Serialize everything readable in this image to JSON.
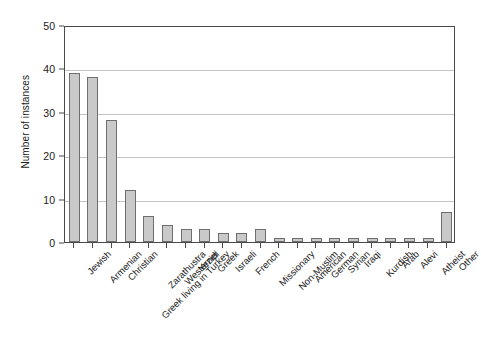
{
  "chart_data": {
    "type": "bar",
    "title": "",
    "subtitle": "",
    "xlabel": "",
    "ylabel": "Number of instances",
    "ylim": [
      0,
      50
    ],
    "yticks": [
      0,
      10,
      20,
      30,
      40,
      50
    ],
    "grid": "horizontal",
    "legend": "none",
    "orientation": "vertical",
    "bar_color": "#c9c9c9",
    "bar_edge_color": "#6e6e6e",
    "axis_color": "#4a4a4a",
    "grid_color": "#c4c4c4",
    "background_color": "#ffffff",
    "categories": [
      "Jewish",
      "Armenian",
      "Christian",
      "Greek living in Turkey",
      "Zarathustra",
      "Westerner",
      "Yezidi",
      "Greek",
      "Israeli",
      "French",
      "Missionary",
      "Non-Muslim",
      "American",
      "German",
      "Syrian",
      "Iraqi",
      "Kurdish",
      "Arab",
      "Alevi",
      "Atheist",
      "Other"
    ],
    "values": [
      39,
      38,
      28,
      12,
      6,
      4,
      3,
      3,
      2,
      2,
      3,
      1,
      1,
      1,
      1,
      1,
      1,
      1,
      1,
      1,
      7
    ]
  }
}
